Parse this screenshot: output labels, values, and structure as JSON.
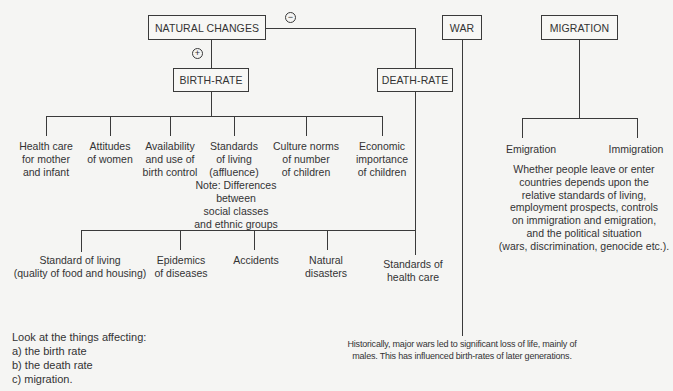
{
  "diagram": {
    "nodes": {
      "natural_changes": "NATURAL CHANGES",
      "birth_rate": "BIRTH-RATE",
      "death_rate": "DEATH-RATE",
      "war": "WAR",
      "migration": "MIGRATION"
    },
    "signs": {
      "birth_rate": "+",
      "death_rate": "−"
    },
    "birth_factors": [
      "Health care\nfor mother\nand infant",
      "Attitudes\nof women",
      "Availability\nand use of\nbirth control",
      "Standards\nof living\n(affluence)",
      "Culture norms\nof number\nof children",
      "Economic\nimportance\nof children"
    ],
    "birth_note": "Note: Differences\nbetween\nsocial classes\nand ethnic groups",
    "death_factors": [
      "Standard of living\n(quality of food and housing)",
      "Epidemics\nof diseases",
      "Accidents",
      "Natural\ndisasters",
      "Standards of\nhealth care"
    ],
    "migration_types": [
      "Emigration",
      "Immigration"
    ],
    "migration_note": "Whether people leave or enter\ncountries depends upon the\nrelative standards of living,\nemployment prospects, controls\non immigration and emigration,\nand the political situation\n(wars, discrimination, genocide etc.).",
    "war_note": "Historically, major wars led to significant loss of life, mainly of\nmales. This has influenced birth-rates of later generations."
  },
  "task": {
    "intro": "Look at the things affecting:",
    "items": [
      "a) the birth rate",
      "b) the death rate",
      "c) migration."
    ]
  }
}
